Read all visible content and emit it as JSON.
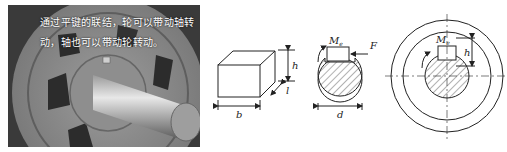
{
  "photo": {
    "caption_line1": "通过平键的联结，轮可以带动轴转",
    "caption_line2": "动，轴也可以带动轮转动。",
    "subject": "wheel-hub-with-flat-key-and-shaft"
  },
  "diagram_key": {
    "labels": {
      "height": "h",
      "length": "l",
      "width": "b"
    }
  },
  "diagram_shaft_section": {
    "labels": {
      "moment": "M",
      "moment_sub": "e",
      "force": "F",
      "diameter": "d"
    }
  },
  "diagram_hub_section": {
    "labels": {
      "moment": "M",
      "moment_sub": "e",
      "height": "h"
    }
  },
  "colors": {
    "line": "#222222",
    "photo_bg": "#6d6d6d",
    "caption": "#ffffff"
  }
}
